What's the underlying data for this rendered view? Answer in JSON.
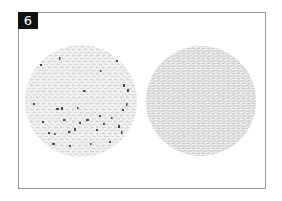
{
  "figure": {
    "panel_label": "6",
    "frame_color": "#9a9a9a",
    "label_bg": "#111111",
    "label_fg": "#ffffff"
  },
  "images": [
    {
      "name": "left-circle",
      "description": "labyrinth texture with dark specks",
      "texture_color": "#c8c8c8",
      "speck_color": "#4a4a4a"
    },
    {
      "name": "right-circle",
      "description": "dense labyrinth/maze texture",
      "texture_color": "#a8a8a8"
    }
  ]
}
